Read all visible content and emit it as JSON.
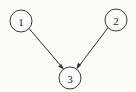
{
  "figure": {
    "type": "directed-graph",
    "title": "",
    "background_color": "#fbfbfa",
    "stroke_color": "#2e2e2e",
    "label_color": "#1c1c1c"
  },
  "graph": {
    "nodes": [
      {
        "id": "1",
        "label": "1",
        "cx": 21,
        "cy": 21,
        "r": 11
      },
      {
        "id": "2",
        "label": "2",
        "cx": 116,
        "cy": 20,
        "r": 11
      },
      {
        "id": "3",
        "label": "3",
        "cx": 70,
        "cy": 78,
        "r": 11
      }
    ],
    "edges": [
      {
        "from": "1",
        "to": "3",
        "directed": true,
        "arrowhead": "filled"
      },
      {
        "from": "2",
        "to": "3",
        "directed": true,
        "arrowhead": "filled"
      }
    ]
  }
}
